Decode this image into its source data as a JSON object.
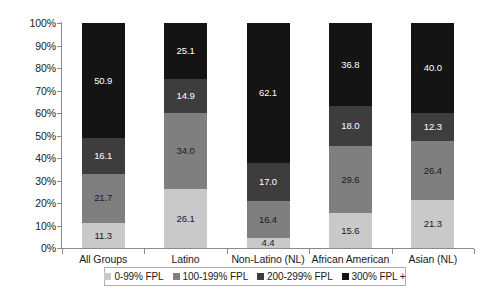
{
  "chart_data": {
    "type": "bar",
    "stacked": true,
    "stack_mode": "percent",
    "title": "",
    "subtitle": "",
    "xlabel": "",
    "ylabel": "",
    "ylim": [
      0,
      100
    ],
    "ytick_labels": [
      "100%",
      "90%",
      "80%",
      "70%",
      "60%",
      "50%",
      "40%",
      "30%",
      "20%",
      "10%",
      "0%"
    ],
    "ytick_values": [
      100,
      90,
      80,
      70,
      60,
      50,
      40,
      30,
      20,
      10,
      0
    ],
    "grid": false,
    "legend_position": "bottom",
    "categories": [
      "All Groups",
      "Latino",
      "Non-Latino (NL) white",
      "African American (NL)",
      "Asian (NL)"
    ],
    "category_lines": [
      [
        "All Groups"
      ],
      [
        "Latino"
      ],
      [
        "Non-Latino (NL)",
        "white"
      ],
      [
        "African American",
        "(NL)"
      ],
      [
        "Asian (NL)"
      ]
    ],
    "series": [
      {
        "name": "0-99% FPL",
        "color": "#c9c9c9",
        "values": [
          11.3,
          26.1,
          4.4,
          15.6,
          21.3
        ]
      },
      {
        "name": "100-199% FPL",
        "color": "#7f7f7f",
        "values": [
          21.7,
          34.0,
          16.4,
          29.6,
          26.4
        ]
      },
      {
        "name": "200-299% FPL",
        "color": "#3d3d3d",
        "values": [
          16.1,
          14.9,
          17.0,
          18.0,
          12.3
        ]
      },
      {
        "name": "300% FPL +",
        "color": "#141414",
        "values": [
          50.9,
          25.1,
          62.1,
          36.8,
          40.0
        ]
      }
    ],
    "value_labels": [
      [
        "11.3",
        "21.7",
        "16.1",
        "50.9"
      ],
      [
        "26.1",
        "34.0",
        "14.9",
        "25.1"
      ],
      [
        "4.4",
        "16.4",
        "17.0",
        "62.1"
      ],
      [
        "15.6",
        "29.6",
        "18.0",
        "36.8"
      ],
      [
        "21.3",
        "26.4",
        "12.3",
        "40.0"
      ]
    ]
  },
  "legend": {
    "items": [
      {
        "label": "0-99% FPL",
        "color": "#c9c9c9"
      },
      {
        "label": "100-199% FPL",
        "color": "#7f7f7f"
      },
      {
        "label": "200-299% FPL",
        "color": "#3d3d3d"
      },
      {
        "label": "300% FPL +",
        "color": "#141414"
      }
    ]
  },
  "colors": {
    "axis": "#8a8a8a",
    "text": "#1a1a1a",
    "background": "#ffffff",
    "legend_border": "#b0b0b0"
  }
}
